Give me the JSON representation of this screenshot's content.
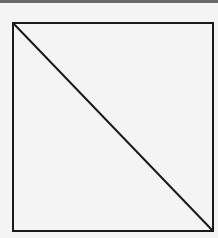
{
  "diagram": {
    "shape": "square-with-diagonal",
    "square": {
      "x": 13,
      "y": 23,
      "width": 200,
      "height": 208
    },
    "diagonal": {
      "from": "top-left",
      "to": "bottom-right"
    },
    "stroke_color": "#1a1a1a",
    "background_color": "#f4f4f4",
    "top_band_color": "#6a6a6a"
  }
}
